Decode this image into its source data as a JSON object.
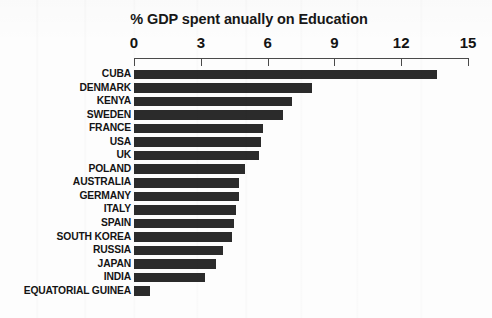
{
  "chart_data": {
    "type": "bar",
    "orientation": "horizontal",
    "title": "% GDP spent anually on Education",
    "xlabel": "",
    "ylabel": "",
    "xlim": [
      0,
      15
    ],
    "grid": false,
    "legend": null,
    "axis_ticks": [
      0,
      3,
      6,
      9,
      12,
      15
    ],
    "tick_labels": [
      "0",
      "3",
      "6",
      "9",
      "12",
      "15"
    ],
    "bar_color": "#2b2b2b",
    "background_color": "#fdfdfd",
    "categories": [
      "CUBA",
      "DENMARK",
      "KENYA",
      "SWEDEN",
      "FRANCE",
      "USA",
      "UK",
      "POLAND",
      "AUSTRALIA",
      "GERMANY",
      "ITALY",
      "SPAIN",
      "SOUTH KOREA",
      "RUSSIA",
      "JAPAN",
      "INDIA",
      "EQUATORIAL GUINEA"
    ],
    "values": [
      13.6,
      8.0,
      7.1,
      6.7,
      5.8,
      5.7,
      5.6,
      5.0,
      4.7,
      4.7,
      4.6,
      4.5,
      4.4,
      4.0,
      3.7,
      3.2,
      0.7
    ]
  }
}
